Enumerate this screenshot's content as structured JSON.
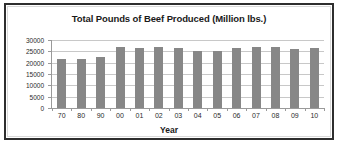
{
  "chart_data": {
    "type": "bar",
    "title": "Total Pounds of Beef Produced (Million lbs.)",
    "xlabel": "Year",
    "ylabel": "",
    "categories": [
      "70",
      "80",
      "90",
      "00",
      "01",
      "02",
      "03",
      "04",
      "05",
      "06",
      "07",
      "08",
      "09",
      "10"
    ],
    "values": [
      21500,
      21500,
      22500,
      27000,
      26400,
      27000,
      26400,
      25000,
      25000,
      26400,
      27000,
      27000,
      26000,
      26400
    ],
    "ylim": [
      0,
      30000
    ],
    "yticks": [
      0,
      5000,
      10000,
      15000,
      20000,
      25000,
      30000
    ],
    "ytick_labels": [
      "0",
      "5000",
      "10000",
      "15000",
      "20000",
      "25000",
      "30000"
    ],
    "grid": true,
    "legend": false,
    "series_color": "#878787"
  },
  "style": {
    "bar_color": "#878787",
    "grid_color": "#c8c8c8",
    "axis_color": "#9a9a9a",
    "frame_color": "#2e2e2e",
    "text_color": "#1a1a1a",
    "background": "#ffffff"
  }
}
